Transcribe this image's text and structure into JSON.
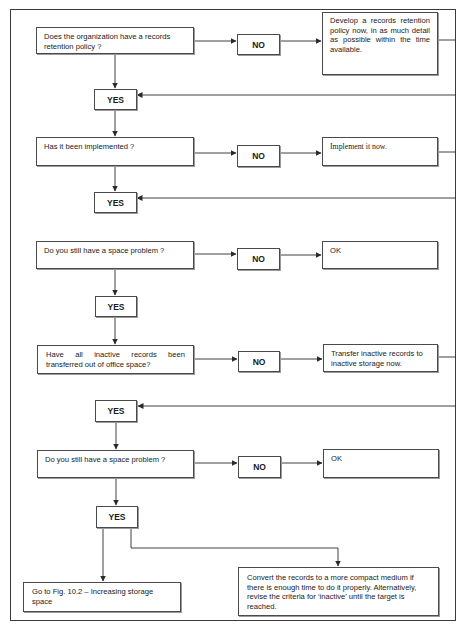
{
  "flowchart": {
    "steps": [
      {
        "question": "Does the organization have a records retention policy ?",
        "no_label": "NO",
        "no_action": "Develop a records retention policy now, in as much detail as possible within the time available.",
        "yes_label": "YES"
      },
      {
        "question": "Has it been implemented ?",
        "no_label": "NO",
        "no_action": "Implement it now.",
        "yes_label": "YES"
      },
      {
        "question": "Do you still have a space problem ?",
        "no_label": "NO",
        "no_action": "OK",
        "yes_label": "YES"
      },
      {
        "question": "Have all inactive records been transferred out of office space?",
        "no_label": "NO",
        "no_action": "Transfer inactive records to inactive storage now.",
        "yes_label": "YES"
      },
      {
        "question": "Do you still have a space problem ?",
        "no_label": "NO",
        "no_action": "OK",
        "yes_label": "YES"
      }
    ],
    "final_outcomes": {
      "left": "Go to Fig. 10.2 – Increasing storage space",
      "right": "Convert the records to a more compact medium if there is enough time to do it properly. Alternatively, revise the criteria for ‘inactive’ until the target is reached."
    }
  },
  "colors": {
    "line": "#2a2a2a",
    "border": "#4a4a4a",
    "background": "#ffffff"
  }
}
